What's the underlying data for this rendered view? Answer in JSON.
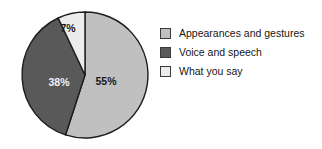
{
  "chart_data": {
    "type": "pie",
    "title": "",
    "subtitle": "",
    "xlabel": "",
    "ylabel": "",
    "grid": false,
    "legend_position": "right",
    "categories": [
      "Appearances and gestures",
      "Voice and speech",
      "What you say"
    ],
    "values": [
      55,
      38,
      7
    ],
    "value_labels": [
      "55%",
      "38%",
      "7%"
    ],
    "colors": [
      "#c0c0c0",
      "#595959",
      "#ececec"
    ],
    "label_text_colors": [
      "#1a1a1a",
      "#f2f2f2",
      "#1a1a1a"
    ],
    "start_angle_deg": 0,
    "direction": "clockwise",
    "units": "percent",
    "slices": [
      {
        "label": "Appearances and gestures",
        "value": 55,
        "display": "55%",
        "color": "#c0c0c0"
      },
      {
        "label": "Voice and speech",
        "value": 38,
        "display": "38%",
        "color": "#595959"
      },
      {
        "label": "What you say",
        "value": 7,
        "display": "7%",
        "color": "#ececec"
      }
    ]
  },
  "pie": {
    "center_x": 67,
    "center_y": 69,
    "radius": 63,
    "stroke_color": "#1d1d1d",
    "labels": [
      {
        "name": "slice-label-55",
        "text": "55%",
        "x": 88,
        "y": 79,
        "tone": "dark"
      },
      {
        "name": "slice-label-38",
        "text": "38%",
        "x": 41,
        "y": 80,
        "tone": "light"
      },
      {
        "name": "slice-label-7",
        "text": "7%",
        "x": 50,
        "y": 26,
        "tone": "dark"
      }
    ]
  },
  "legend": {
    "items": [
      {
        "label": "Appearances and gestures",
        "color": "#c0c0c0"
      },
      {
        "label": "Voice and speech",
        "color": "#595959"
      },
      {
        "label": "What you say",
        "color": "#ececec"
      }
    ]
  }
}
